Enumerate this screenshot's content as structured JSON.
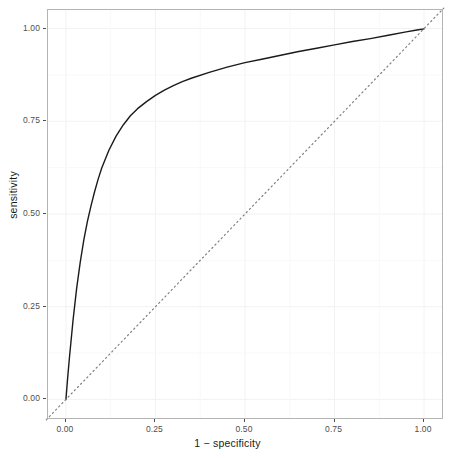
{
  "chart_data": {
    "type": "line",
    "title": "",
    "subtitle": "",
    "xlabel": "1 − specificity",
    "ylabel": "sensitivity",
    "xlim": [
      0,
      1
    ],
    "ylim": [
      0,
      1
    ],
    "grid": true,
    "legend": "none",
    "x_ticks": [
      "0.00",
      "0.25",
      "0.50",
      "0.75",
      "1.00"
    ],
    "x_tick_values": [
      0,
      0.25,
      0.5,
      0.75,
      1
    ],
    "y_ticks": [
      "0.00",
      "0.25",
      "0.50",
      "0.75",
      "1.00"
    ],
    "y_tick_values": [
      0,
      0.25,
      0.5,
      0.75,
      1
    ],
    "series": [
      {
        "name": "roc-curve",
        "style": "solid",
        "color": "#1a1a1a",
        "width": 1.4,
        "x": [
          0.0,
          0.005,
          0.01,
          0.02,
          0.03,
          0.04,
          0.05,
          0.06,
          0.07,
          0.08,
          0.09,
          0.1,
          0.12,
          0.14,
          0.16,
          0.18,
          0.2,
          0.225,
          0.25,
          0.275,
          0.3,
          0.325,
          0.35,
          0.4,
          0.45,
          0.5,
          0.55,
          0.6,
          0.65,
          0.7,
          0.75,
          0.8,
          0.85,
          0.9,
          0.95,
          0.98,
          1.0
        ],
        "y": [
          0.0,
          0.06,
          0.115,
          0.215,
          0.3,
          0.37,
          0.43,
          0.48,
          0.522,
          0.56,
          0.594,
          0.624,
          0.672,
          0.71,
          0.74,
          0.765,
          0.784,
          0.803,
          0.82,
          0.834,
          0.846,
          0.857,
          0.866,
          0.882,
          0.896,
          0.908,
          0.918,
          0.928,
          0.938,
          0.947,
          0.956,
          0.965,
          0.973,
          0.982,
          0.991,
          0.996,
          0.999
        ]
      },
      {
        "name": "chance-diagonal",
        "style": "dotted",
        "color": "#808080",
        "width": 1.2,
        "x": [
          -0.055,
          1.055
        ],
        "y": [
          -0.055,
          1.055
        ]
      }
    ],
    "auc_estimate": 0.87
  }
}
